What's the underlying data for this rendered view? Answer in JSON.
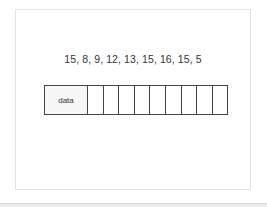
{
  "diagram": {
    "sequence_text": "15, 8, 9, 12, 13, 15, 16, 15, 5",
    "sequence_values": [
      15,
      8,
      9,
      12,
      13,
      15,
      16,
      15,
      5
    ],
    "array": {
      "label": "data",
      "empty_cells": 9
    }
  },
  "colors": {
    "border": "#444444",
    "frame": "#e2e2e2",
    "label_cell_bg": "#f7f7f7",
    "text": "#333333"
  }
}
